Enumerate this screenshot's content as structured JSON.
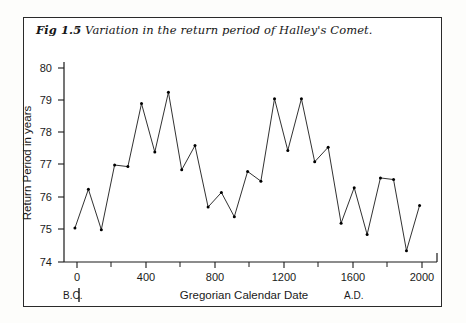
{
  "figure": {
    "number": "Fig 1.5",
    "caption": "Variation in the return period of Halley's Comet."
  },
  "colors": {
    "line": "#1a1a1a",
    "axis": "#1a1a1a",
    "frame": "#2a2a2a",
    "background": "#ffffff",
    "marker": "#000000"
  },
  "axis": {
    "y_title": "Return Period  in years",
    "x_title": "Gregorian  Calendar  Date",
    "era_left": "B.C.",
    "era_right": "A.D.",
    "y_ticks": [
      "74",
      "75",
      "76",
      "77",
      "78",
      "79",
      "80"
    ],
    "x_ticks": [
      "0",
      "400",
      "800",
      "1200",
      "1600",
      "2000"
    ],
    "x_minor_ticks": [
      "200",
      "600",
      "1000",
      "1400",
      "1800"
    ]
  },
  "chart_data": {
    "type": "line",
    "title": "Variation in the return period of Halley's Comet.",
    "xlabel": "Gregorian Calendar Date",
    "ylabel": "Return Period in years",
    "xlim": [
      -70,
      2060
    ],
    "ylim": [
      74,
      80
    ],
    "grid": false,
    "legend": null,
    "marker": "dot",
    "x": [
      -12,
      66,
      141,
      218,
      295,
      374,
      451,
      530,
      607,
      684,
      760,
      837,
      912,
      989,
      1066,
      1145,
      1222,
      1301,
      1378,
      1456,
      1531,
      1607,
      1682,
      1759,
      1835,
      1910,
      1986
    ],
    "y": [
      75.05,
      76.25,
      75.0,
      77.0,
      76.95,
      78.9,
      77.4,
      79.25,
      76.85,
      77.6,
      75.7,
      76.15,
      75.4,
      76.8,
      76.5,
      79.05,
      77.45,
      79.05,
      77.1,
      77.55,
      75.2,
      76.3,
      74.85,
      76.6,
      76.55,
      74.35,
      75.75
    ]
  }
}
